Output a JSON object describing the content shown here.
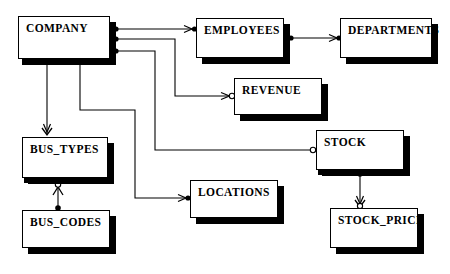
{
  "diagram": {
    "type": "er-diagram",
    "notation": "crow's-foot",
    "background_color": "#ffffff",
    "line_color": "#000000",
    "entity_fill": "#ffffff",
    "entity_border": "#000000",
    "shadow_color": "#000000",
    "entities": [
      {
        "id": "company",
        "label": "COMPANY",
        "x": 18,
        "y": 16,
        "w": 92,
        "h": 43
      },
      {
        "id": "employees",
        "label": "EMPLOYEES",
        "x": 196,
        "y": 18,
        "w": 88,
        "h": 40
      },
      {
        "id": "departments",
        "label": "DEPARTMENTS",
        "x": 340,
        "y": 18,
        "w": 92,
        "h": 40
      },
      {
        "id": "revenue",
        "label": "REVENUE",
        "x": 234,
        "y": 78,
        "w": 88,
        "h": 37
      },
      {
        "id": "stock",
        "label": "STOCK",
        "x": 316,
        "y": 130,
        "w": 88,
        "h": 40
      },
      {
        "id": "bus_types",
        "label": "BUS_TYPES",
        "x": 22,
        "y": 137,
        "w": 86,
        "h": 41
      },
      {
        "id": "locations",
        "label": "LOCATIONS",
        "x": 190,
        "y": 180,
        "w": 88,
        "h": 38
      },
      {
        "id": "bus_codes",
        "label": "BUS_CODES",
        "x": 22,
        "y": 210,
        "w": 88,
        "h": 38
      },
      {
        "id": "stock_price",
        "label": "STOCK_PRICE",
        "x": 330,
        "y": 208,
        "w": 88,
        "h": 40
      }
    ],
    "relationships": [
      {
        "id": "company-employees",
        "from": "COMPANY",
        "to": "EMPLOYEES",
        "from_end": "mandatory-one",
        "to_end": "arrow-mandatory"
      },
      {
        "id": "employees-departments",
        "from": "EMPLOYEES",
        "to": "DEPARTMENTS",
        "from_end": "mandatory-one",
        "to_end": "arrow-mandatory"
      },
      {
        "id": "company-revenue",
        "from": "COMPANY",
        "to": "REVENUE",
        "from_end": "mandatory-one",
        "to_end": "arrow-optional"
      },
      {
        "id": "company-stock",
        "from": "COMPANY",
        "to": "STOCK",
        "from_end": "mandatory-one",
        "to_end": "optional"
      },
      {
        "id": "company-bus_types",
        "from": "COMPANY",
        "to": "BUS_TYPES",
        "from_end": "mandatory-one",
        "to_end": "crowsfoot"
      },
      {
        "id": "company-locations",
        "from": "COMPANY",
        "to": "LOCATIONS",
        "from_end": "mandatory-one",
        "to_end": "arrow-mandatory"
      },
      {
        "id": "bus_types-bus_codes",
        "from": "BUS_CODES",
        "to": "BUS_TYPES",
        "from_end": "mandatory-one",
        "to_end": "crowsfoot-optional"
      },
      {
        "id": "stock-stock_price",
        "from": "STOCK",
        "to": "STOCK_PRICE",
        "from_end": "mandatory-one",
        "to_end": "crowsfoot-optional"
      }
    ]
  }
}
